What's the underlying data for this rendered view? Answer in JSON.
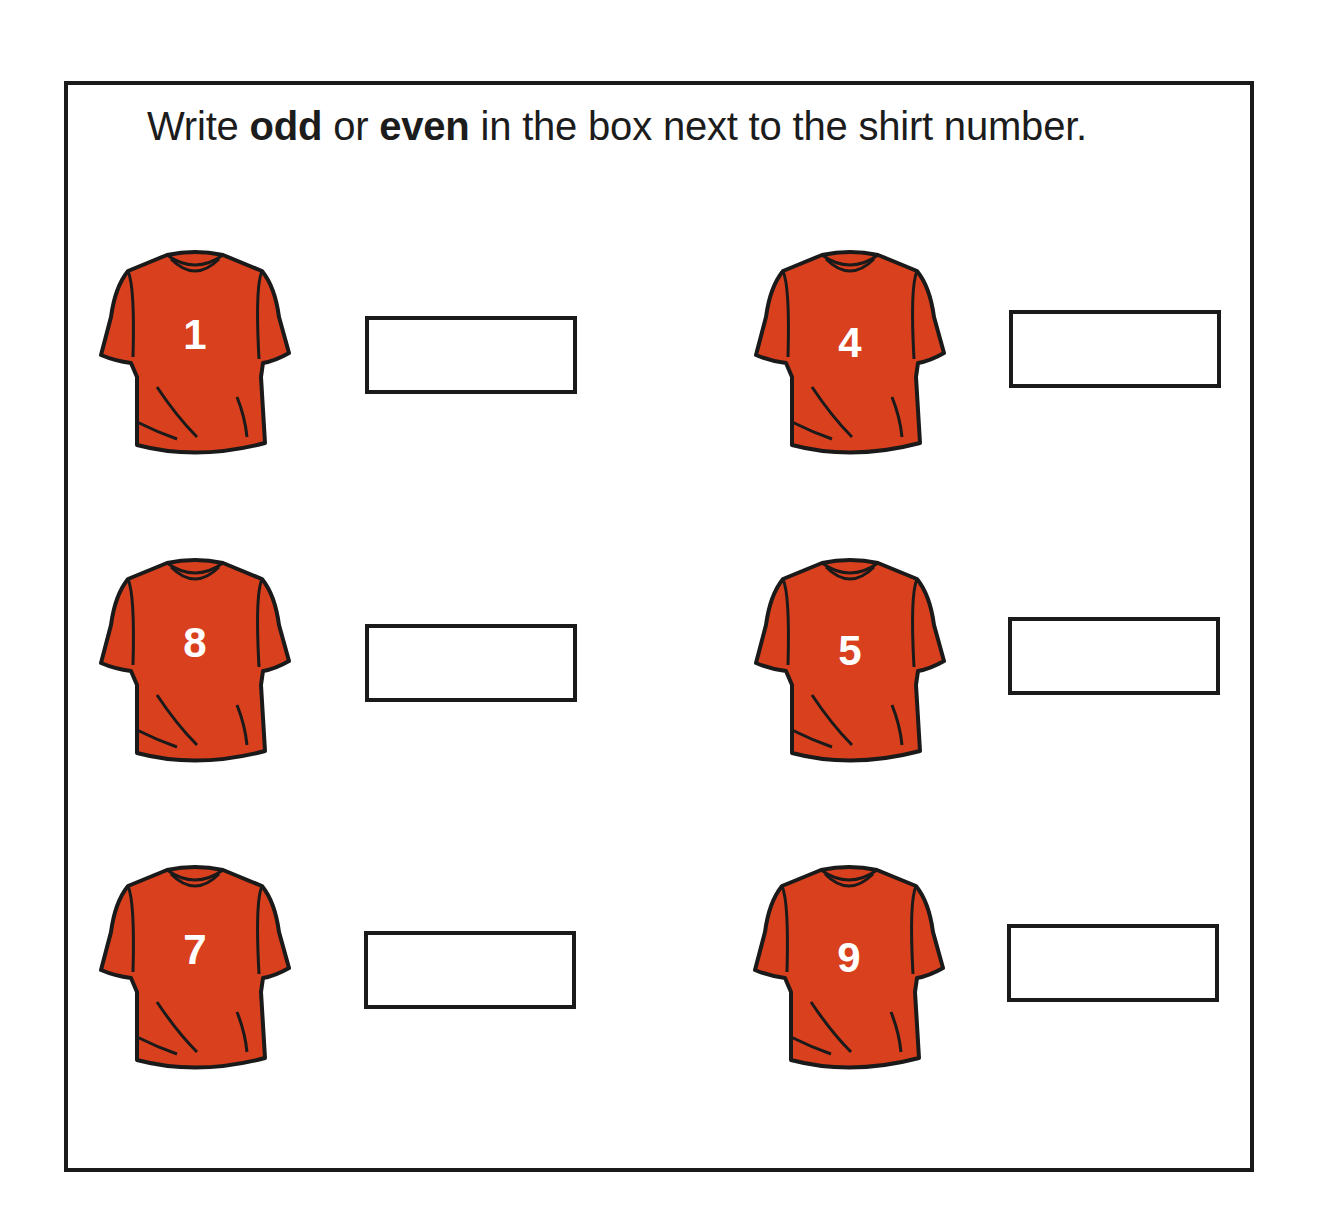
{
  "instruction": {
    "prefix": "Write ",
    "word1": "odd",
    "middle": " or ",
    "word2": "even",
    "suffix": " in the box next to the shirt number."
  },
  "colors": {
    "shirt": "#D9401E",
    "outline": "#1a1a1a",
    "number": "#ffffff"
  },
  "items": [
    {
      "number": "1",
      "answer": "",
      "shirt_icon": "t-shirt-icon"
    },
    {
      "number": "4",
      "answer": "",
      "shirt_icon": "t-shirt-icon"
    },
    {
      "number": "8",
      "answer": "",
      "shirt_icon": "t-shirt-icon"
    },
    {
      "number": "5",
      "answer": "",
      "shirt_icon": "t-shirt-icon"
    },
    {
      "number": "7",
      "answer": "",
      "shirt_icon": "t-shirt-icon"
    },
    {
      "number": "9",
      "answer": "",
      "shirt_icon": "t-shirt-icon"
    }
  ]
}
